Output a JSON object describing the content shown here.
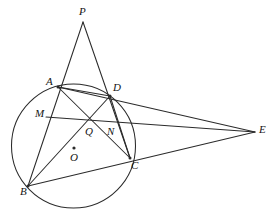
{
  "figure": {
    "type": "euclidean-geometry-diagram",
    "canvas": {
      "width": 276,
      "height": 219
    },
    "background_color": "#ffffff",
    "stroke_color": "#2b2b2b",
    "label_color": "#141414"
  },
  "circle": {
    "name": "circumcircle-O",
    "center": {
      "x": 73.5,
      "y": 146.0
    },
    "radius": 62.0,
    "center_marker_label": "O",
    "center_marker": {
      "x": 74,
      "y": 148
    }
  },
  "points": [
    {
      "id": "P",
      "label": "P",
      "x": 83,
      "y": 22,
      "label_x": 79,
      "label_y": 6,
      "on_circle": false,
      "has_dot": false
    },
    {
      "id": "A",
      "label": "A",
      "x": 58,
      "y": 87,
      "label_x": 46,
      "label_y": 76,
      "on_circle": true,
      "has_dot": true
    },
    {
      "id": "D",
      "label": "D",
      "x": 110,
      "y": 96,
      "label_x": 113,
      "label_y": 82,
      "on_circle": true,
      "has_dot": true
    },
    {
      "id": "M",
      "label": "M",
      "x": 48,
      "y": 117,
      "label_x": 35,
      "label_y": 108,
      "on_circle": false,
      "has_dot": false
    },
    {
      "id": "Q",
      "label": "Q",
      "x": 89,
      "y": 122,
      "label_x": 85,
      "label_y": 126,
      "on_circle": false,
      "has_dot": false
    },
    {
      "id": "N",
      "label": "N",
      "x": 110,
      "y": 124,
      "label_x": 107,
      "label_y": 126,
      "on_circle": false,
      "has_dot": false
    },
    {
      "id": "O",
      "label": "O",
      "x": 74,
      "y": 148,
      "label_x": 70,
      "label_y": 152,
      "on_circle": false,
      "has_dot": true
    },
    {
      "id": "C",
      "label": "C",
      "x": 130,
      "y": 158,
      "label_x": 131,
      "label_y": 160,
      "on_circle": true,
      "has_dot": true
    },
    {
      "id": "B",
      "label": "B",
      "x": 28,
      "y": 186,
      "label_x": 20,
      "label_y": 186,
      "on_circle": true,
      "has_dot": true
    },
    {
      "id": "E",
      "label": "E",
      "x": 255,
      "y": 132,
      "label_x": 259,
      "label_y": 124,
      "on_circle": false,
      "has_dot": false
    }
  ],
  "segments": [
    {
      "name": "segment-P-A-B",
      "from": "P",
      "to": "B",
      "via": "A",
      "path": "83,22 28,186"
    },
    {
      "name": "segment-P-D-C",
      "from": "P",
      "to": "C",
      "via": "D",
      "path": "83,22 130,158"
    },
    {
      "name": "segment-A-D",
      "from": "A",
      "to": "D",
      "path": "58,87 110,96"
    },
    {
      "name": "segment-A-C",
      "from": "A",
      "to": "C",
      "path": "58,87 130,158"
    },
    {
      "name": "segment-B-D",
      "from": "B",
      "to": "D",
      "path": "28,186 110,96"
    },
    {
      "name": "segment-B-C-E",
      "from": "B",
      "to": "E",
      "via": "C",
      "path": "28,186 255,132"
    },
    {
      "name": "segment-A-E",
      "from": "A",
      "to": "E",
      "via": "D",
      "path": "58,87 255,132"
    },
    {
      "name": "segment-M-Q-E",
      "from": "M",
      "to": "E",
      "via": "Q",
      "path": "46,117 255,132"
    },
    {
      "name": "segment-D-C",
      "from": "D",
      "to": "C",
      "path": "110,96 130,158"
    }
  ],
  "labels_order": [
    "P",
    "A",
    "D",
    "M",
    "Q",
    "N",
    "O",
    "C",
    "B",
    "E"
  ]
}
